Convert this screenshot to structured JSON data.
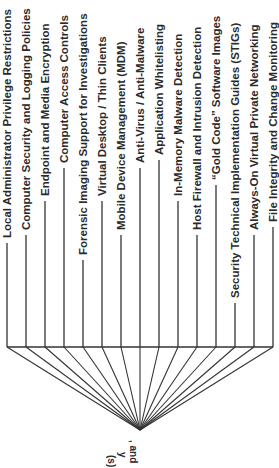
{
  "diagram": {
    "orientation": "rotated-90",
    "line_color": "#333333",
    "text_color": "#2a2a2a",
    "root": {
      "label_fragments": [
        ", and",
        "y",
        "(s)"
      ]
    },
    "leaves": [
      {
        "label": "Local Administrator Privilege Restrictions"
      },
      {
        "label": "Computer Security and Logging Policies"
      },
      {
        "label": "Endpoint and Media Encryption"
      },
      {
        "label": "Computer Access Controls"
      },
      {
        "label": "Forensic Imaging Support for Investigations"
      },
      {
        "label": "Virtual Desktop / Thin Clients"
      },
      {
        "label": "Mobile Device Management (MDM)"
      },
      {
        "label": "Anti-Virus / Anti-Malware"
      },
      {
        "label": "Application Whitelisting"
      },
      {
        "label": "In-Memory Malware Detection"
      },
      {
        "label": "Host Firewall and Intrusion Detection"
      },
      {
        "label": "“Gold Code” Software Images"
      },
      {
        "label": "Security Technical Implementation Guides (STIGs)"
      },
      {
        "label": "Always-On Virtual Private Networking"
      },
      {
        "label": "File Integrity and Change Monitoring"
      }
    ]
  }
}
